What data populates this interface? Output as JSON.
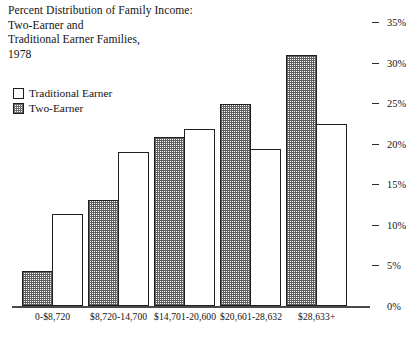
{
  "title": {
    "line1": "Percent Distribution of Family Income:",
    "line2": "Two-Earner and",
    "line3": "Traditional Earner Families,",
    "line4": "1978"
  },
  "legend": {
    "items": [
      {
        "label": "Traditional Earner",
        "swatch": "open-square-icon"
      },
      {
        "label": "Two-Earner",
        "swatch": "shaded-square-icon"
      }
    ]
  },
  "axis": {
    "ticks": [
      "35%",
      "30%",
      "25%",
      "20%",
      "15%",
      "10%",
      "5%",
      "0%"
    ]
  },
  "chart_data": {
    "type": "bar",
    "title": "Percent Distribution of Family Income: Two-Earner and Traditional Earner Families, 1978",
    "xlabel": "",
    "ylabel": "",
    "ylim": [
      0,
      35
    ],
    "ytick_values": [
      0,
      5,
      10,
      15,
      20,
      25,
      30,
      35
    ],
    "ytick_labels": [
      "0%",
      "5%",
      "10%",
      "15%",
      "20%",
      "25%",
      "30%",
      "35%"
    ],
    "axis_position": "right",
    "grid": false,
    "legend_position": "upper-left",
    "categories": [
      "0-$8,720",
      "$8,720-14,700",
      "$14,701-20,600",
      "$20,601-28,632",
      "$28,633+"
    ],
    "series": [
      {
        "name": "Two-Earner",
        "fill": "shaded",
        "values": [
          4.3,
          13.1,
          20.8,
          24.9,
          31.0
        ]
      },
      {
        "name": "Traditional Earner",
        "fill": "open",
        "values": [
          11.3,
          19.0,
          21.8,
          19.4,
          22.4
        ]
      }
    ]
  },
  "colors": {
    "line": "#1f1f1f",
    "text": "#141414",
    "shade": "#5f5f5f",
    "background": "#ffffff"
  }
}
